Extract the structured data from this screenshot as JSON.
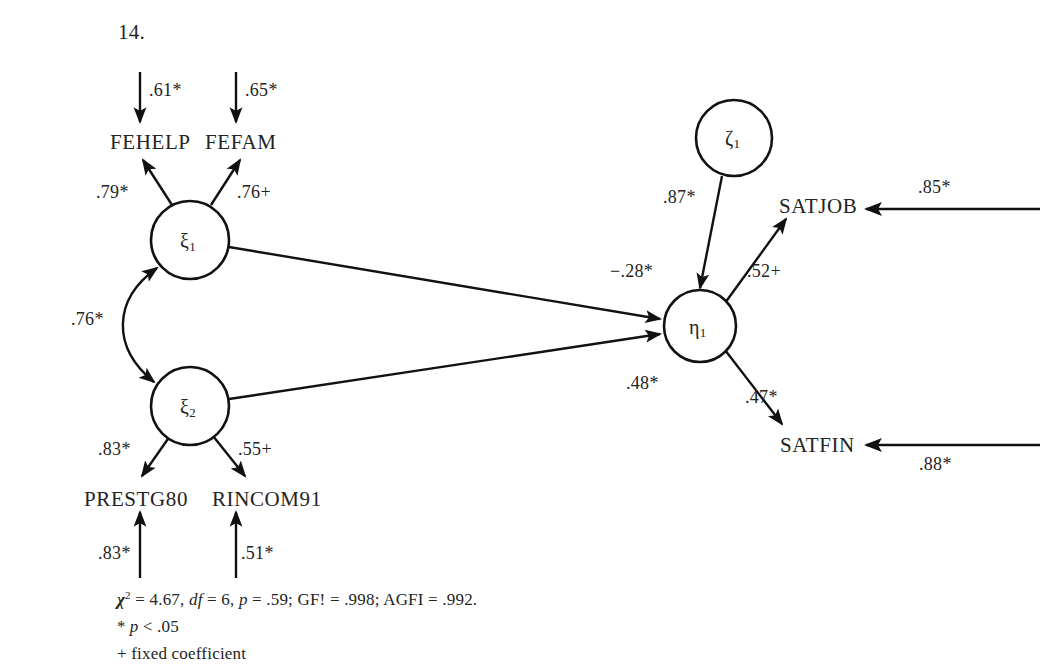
{
  "figure": {
    "number": "14."
  },
  "latent_variables": [
    {
      "id": "xi1",
      "symbol": "ξ",
      "subscript": "1",
      "cx": 190,
      "cy": 240,
      "r": 39
    },
    {
      "id": "xi2",
      "symbol": "ξ",
      "subscript": "2",
      "cx": 190,
      "cy": 406,
      "r": 39
    },
    {
      "id": "eta1",
      "symbol": "η",
      "subscript": "1",
      "cx": 700,
      "cy": 326,
      "r": 36
    },
    {
      "id": "zeta1",
      "symbol": "ζ",
      "subscript": "1",
      "cx": 734,
      "cy": 138,
      "r": 38
    }
  ],
  "observed_variables": [
    {
      "id": "fehelp",
      "label": "FEHELP",
      "x": 110,
      "y": 132
    },
    {
      "id": "fefam",
      "label": "FEFAM",
      "x": 205,
      "y": 132
    },
    {
      "id": "prestg80",
      "label": "PRESTG80",
      "x": 84,
      "y": 489
    },
    {
      "id": "rincom91",
      "label": "RINCOM91",
      "x": 212,
      "y": 489
    },
    {
      "id": "satjob",
      "label": "SATJOB",
      "x": 779,
      "y": 196
    },
    {
      "id": "satfin",
      "label": "SATFIN",
      "x": 780,
      "y": 435
    }
  ],
  "coefficients": [
    {
      "id": "err-fehelp",
      "value": ".61*",
      "x": 149,
      "y": 81,
      "desc": "error-fehelp"
    },
    {
      "id": "err-fefam",
      "value": ".65*",
      "x": 245,
      "y": 81,
      "desc": "error-fefam"
    },
    {
      "id": "load-fehelp",
      "value": ".79*",
      "x": 96,
      "y": 183,
      "desc": "loading-xi1-fehelp"
    },
    {
      "id": "load-fefam",
      "value": ".76+",
      "x": 237,
      "y": 183,
      "desc": "loading-xi1-fefam"
    },
    {
      "id": "cov-xi1-xi2",
      "value": ".76*",
      "x": 71,
      "y": 310,
      "desc": "covariance-xi1-xi2"
    },
    {
      "id": "load-prestg80",
      "value": ".83*",
      "x": 98,
      "y": 440,
      "desc": "loading-xi2-prestg80"
    },
    {
      "id": "load-rincom91",
      "value": ".55+",
      "x": 238,
      "y": 440,
      "desc": "loading-xi2-rincom91"
    },
    {
      "id": "err-prestg80",
      "value": ".83*",
      "x": 98,
      "y": 544,
      "desc": "error-prestg80"
    },
    {
      "id": "err-rincom91",
      "value": ".51*",
      "x": 241,
      "y": 544,
      "desc": "error-rincom91"
    },
    {
      "id": "path-xi1-eta1",
      "value": "−.28*",
      "x": 610,
      "y": 262,
      "desc": "path-xi1-eta1"
    },
    {
      "id": "path-xi2-eta1",
      "value": ".48*",
      "x": 626,
      "y": 374,
      "desc": "path-xi2-eta1"
    },
    {
      "id": "dist-eta1",
      "value": ".87*",
      "x": 663,
      "y": 188,
      "desc": "disturbance-zeta1-eta1"
    },
    {
      "id": "load-satjob",
      "value": ".52+",
      "x": 747,
      "y": 262,
      "desc": "loading-eta1-satjob"
    },
    {
      "id": "load-satfin",
      "value": ".47*",
      "x": 745,
      "y": 388,
      "desc": "loading-eta1-satfin"
    },
    {
      "id": "err-satjob",
      "value": ".85*",
      "x": 918,
      "y": 178,
      "desc": "error-satjob"
    },
    {
      "id": "err-satfin",
      "value": ".88*",
      "x": 919,
      "y": 455,
      "desc": "error-satfin"
    }
  ],
  "footnote": {
    "chi_symbol": "χ",
    "chi_sup": "2",
    "fit_line_part1": " = 4.67, ",
    "df_label": "df",
    "fit_line_part2": " = 6, ",
    "p_label": "p",
    "fit_line_part3": " = .59; GF! = .998; AGFI = .992.",
    "sig_star": "*",
    "sig_p": "p",
    "sig_rest": " < .05",
    "fixed_note": "+ fixed coefficient"
  }
}
